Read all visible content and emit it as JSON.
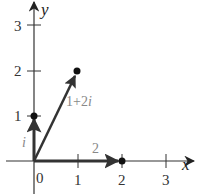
{
  "axes": {
    "x_label": "x",
    "y_label": "y",
    "origin_label": "0",
    "x_ticks": [
      "1",
      "2",
      "3"
    ],
    "y_ticks": [
      "1",
      "2",
      "3"
    ]
  },
  "vectors": [
    {
      "name": "i",
      "label": "i",
      "from": [
        0,
        0
      ],
      "to": [
        0,
        1
      ]
    },
    {
      "name": "two",
      "label": "2",
      "from": [
        0,
        0
      ],
      "to": [
        2,
        0
      ]
    },
    {
      "name": "one-plus-two-i",
      "label_real": "1+2",
      "label_imag": "i",
      "from": [
        0,
        0
      ],
      "to": [
        1,
        2
      ]
    }
  ],
  "colors": {
    "axis": "#333333",
    "vector": "#333333",
    "label": "#888888"
  }
}
